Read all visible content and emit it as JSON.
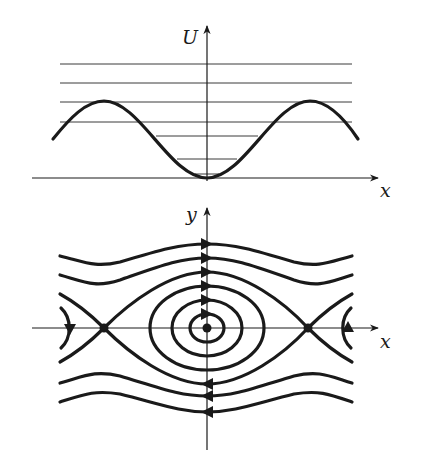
{
  "top_panel": {
    "title": "Potential energy",
    "y_axis_label": "U",
    "x_axis_label": "x",
    "curve": "U = 1 - cos x (periodic, minimum at origin, maxima at ±π)",
    "energy_levels_count": 7,
    "colors": {
      "curve": "#1a1a1a",
      "levels": "#3a3a3a",
      "axes": "#1a1a1a"
    }
  },
  "bottom_panel": {
    "title": "Phase portrait",
    "y_axis_label": "y",
    "x_axis_label": "x",
    "fixed_points": [
      {
        "type": "saddle",
        "position": "-π"
      },
      {
        "type": "center",
        "position": "0"
      },
      {
        "type": "saddle",
        "position": "π"
      }
    ],
    "closed_orbits_count": 3,
    "separatrix": "heteroclinic orbits connecting saddles",
    "rotating_orbits_count": 4,
    "flow_direction": {
      "upper_half": "right",
      "lower_half": "left"
    }
  }
}
